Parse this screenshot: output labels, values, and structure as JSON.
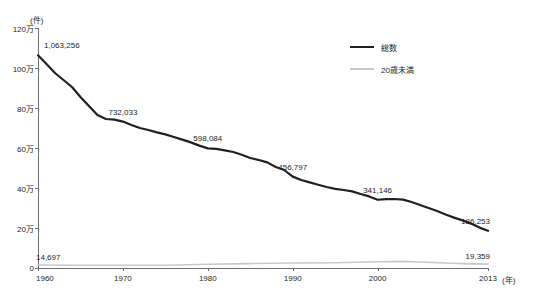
{
  "chart_data": {
    "type": "line",
    "title": "",
    "unit_note": "(件)",
    "xlabel": "(年)",
    "ylabel": "",
    "grid": false,
    "legend_position": "top-right",
    "xlim": [
      1960,
      2013
    ],
    "ylim": [
      0,
      1200000
    ],
    "x_ticks": [
      1960,
      1970,
      1980,
      1990,
      2000,
      2013
    ],
    "x_tick_labels": [
      "1960",
      "1970",
      "1980",
      "1990",
      "2000",
      "2013"
    ],
    "y_ticks": [
      0,
      200000,
      400000,
      600000,
      800000,
      1000000,
      1200000
    ],
    "y_tick_labels": [
      "0",
      "20万",
      "40万",
      "60万",
      "80万",
      "100万",
      "120万"
    ],
    "series": [
      {
        "name": "総数",
        "color": "#231f20",
        "x": [
          1960,
          1961,
          1962,
          1963,
          1964,
          1965,
          1966,
          1967,
          1968,
          1969,
          1970,
          1971,
          1972,
          1973,
          1974,
          1975,
          1976,
          1977,
          1978,
          1979,
          1980,
          1981,
          1982,
          1983,
          1984,
          1985,
          1986,
          1987,
          1988,
          1989,
          1990,
          1991,
          1992,
          1993,
          1994,
          1995,
          1996,
          1997,
          1998,
          1999,
          2000,
          2001,
          2002,
          2003,
          2004,
          2005,
          2006,
          2007,
          2008,
          2009,
          2010,
          2011,
          2012,
          2013
        ],
        "values": [
          1063256,
          1020000,
          975000,
          940000,
          905000,
          855000,
          810000,
          765000,
          745000,
          742000,
          732033,
          715000,
          700000,
          690000,
          678000,
          668000,
          655000,
          642000,
          628000,
          612000,
          598084,
          596000,
          588000,
          580000,
          566000,
          550000,
          540000,
          528000,
          505000,
          490000,
          456797,
          440000,
          428000,
          416000,
          405000,
          396000,
          390000,
          383000,
          370000,
          358000,
          341146,
          344000,
          345000,
          342000,
          330000,
          315000,
          300000,
          285000,
          268000,
          252000,
          238000,
          222000,
          202000,
          186253
        ],
        "labeled_points": [
          {
            "x": 1960,
            "value": 1063256,
            "label": "1,063,256"
          },
          {
            "x": 1970,
            "value": 732033,
            "label": "732,033"
          },
          {
            "x": 1980,
            "value": 598084,
            "label": "598,084"
          },
          {
            "x": 1990,
            "value": 456797,
            "label": "456,797"
          },
          {
            "x": 2000,
            "value": 341146,
            "label": "341,146"
          },
          {
            "x": 2013,
            "value": 186253,
            "label": "186,253"
          }
        ]
      },
      {
        "name": "20歳未満",
        "color": "#c8c8c8",
        "x": [
          1960,
          1965,
          1970,
          1975,
          1980,
          1985,
          1990,
          1995,
          2000,
          2003,
          2005,
          2008,
          2010,
          2013
        ],
        "values": [
          14697,
          14000,
          13500,
          14000,
          19000,
          22000,
          25000,
          26000,
          31000,
          33000,
          30000,
          25000,
          22000,
          19359
        ],
        "labeled_points": [
          {
            "x": 1960,
            "value": 14697,
            "label": "14,697"
          },
          {
            "x": 2013,
            "value": 19359,
            "label": "19,359"
          }
        ]
      }
    ],
    "legend": [
      {
        "label": "総数",
        "color": "#231f20"
      },
      {
        "label": "20歳未満",
        "color": "#c8c8c8"
      }
    ]
  }
}
